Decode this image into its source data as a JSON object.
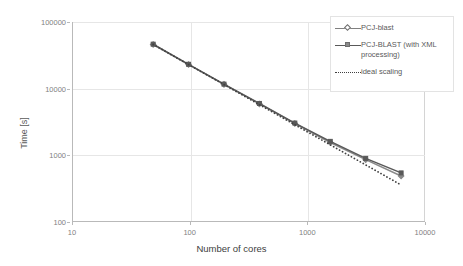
{
  "chart_data": {
    "type": "line",
    "title": "",
    "xlabel": "Number of cores",
    "ylabel": "Time [s]",
    "xscale": "log",
    "yscale": "log",
    "xlim": [
      10,
      10000
    ],
    "ylim": [
      100,
      100000
    ],
    "xticks": [
      10,
      100,
      1000,
      10000
    ],
    "xtick_labels": [
      "10",
      "100",
      "1000",
      "10000"
    ],
    "yticks": [
      100,
      1000,
      10000,
      100000
    ],
    "ytick_labels": [
      "100",
      "1000",
      "10000",
      "100000"
    ],
    "grid": true,
    "legend_position": "top-right",
    "x": [
      48,
      96,
      192,
      384,
      768,
      1536,
      3072,
      6144
    ],
    "series": [
      {
        "name": "PCJ-blast",
        "marker": "diamond",
        "linestyle": "solid",
        "color": "#8a8a8a",
        "values": [
          46000,
          23000,
          11600,
          5900,
          3000,
          1560,
          860,
          490
        ]
      },
      {
        "name": "PCJ-BLAST (with XML processing)",
        "marker": "square",
        "linestyle": "solid",
        "color": "#595959",
        "values": [
          46500,
          23200,
          11700,
          6000,
          3050,
          1620,
          900,
          545
        ]
      },
      {
        "name": "ideal scaling",
        "marker": "none",
        "linestyle": "dotted",
        "color": "#404040",
        "values": [
          46000,
          23000,
          11500,
          5750,
          2875,
          1437,
          719,
          359
        ]
      }
    ]
  },
  "legend": {
    "items": [
      {
        "label": "PCJ-blast"
      },
      {
        "label": "PCJ-BLAST (with XML processing)"
      },
      {
        "label": "ideal scaling"
      }
    ]
  },
  "axes": {
    "x_title": "Number of cores",
    "y_title": "Time [s]"
  }
}
